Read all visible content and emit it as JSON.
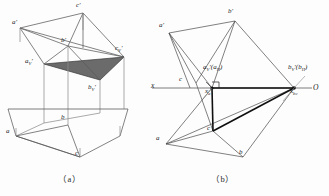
{
  "figure": {
    "title_caption_a": "（a）",
    "title_caption_b": "（b）",
    "colors": {
      "line": "#4a4a4a",
      "heavy_line": "#101010",
      "shade_fill": "#6b6b6b",
      "ground_line": "#5a5a5a",
      "text": "#1d1d1d"
    }
  },
  "panel_a": {
    "caption": "（a）",
    "labels": [
      {
        "name": "a-prime",
        "text": "a'",
        "x": 12,
        "y": 22
      },
      {
        "name": "c-prime",
        "text": "c'",
        "x": 76,
        "y": 4
      },
      {
        "name": "b-prime",
        "text": "b'",
        "x": 61,
        "y": 40
      },
      {
        "name": "cv-prime",
        "text": "c",
        "sub": "V",
        "prime": "'",
        "x": 115,
        "y": 47
      },
      {
        "name": "av-prime",
        "text": "a",
        "sub": "V",
        "prime": "'",
        "x": 25,
        "y": 60
      },
      {
        "name": "bv-prime",
        "text": "b",
        "sub": "V",
        "prime": "'",
        "x": 88,
        "y": 86
      },
      {
        "name": "a-point",
        "text": "a",
        "x": 7,
        "y": 130
      },
      {
        "name": "b-point",
        "text": "b",
        "x": 61,
        "y": 116
      },
      {
        "name": "c-point",
        "text": "c",
        "x": 74,
        "y": 150
      }
    ]
  },
  "panel_b": {
    "caption": "（b）",
    "labels": [
      {
        "name": "a-prime",
        "text": "a'",
        "x": 160,
        "y": 24
      },
      {
        "name": "b-prime",
        "text": "b'",
        "x": 228,
        "y": 10
      },
      {
        "name": "x-axis-label",
        "text": "x",
        "x": 152,
        "y": 84
      },
      {
        "name": "c-prime",
        "text": "c",
        "x": 179,
        "y": 78
      },
      {
        "name": "av-ah",
        "text": "a",
        "sub": "V",
        "prime": "'(a",
        "sub2": "H",
        "tail": ")",
        "x": 205,
        "y": 68
      },
      {
        "name": "xa",
        "text": "x",
        "sub": "a",
        "x": 206,
        "y": 89
      },
      {
        "name": "bv-bh",
        "text": "b",
        "sub": "V",
        "prime": "'(b",
        "sub2": "H",
        "tail": ")",
        "x": 290,
        "y": 68
      },
      {
        "name": "xbc",
        "text": "x",
        "sub": "bc",
        "x": 292,
        "y": 89
      },
      {
        "name": "origin",
        "text": "O",
        "x": 312,
        "y": 86
      },
      {
        "name": "a-point",
        "text": "a",
        "x": 157,
        "y": 137
      },
      {
        "name": "c-point",
        "text": "c",
        "x": 206,
        "y": 126
      },
      {
        "name": "b-point",
        "text": "b",
        "x": 239,
        "y": 150
      }
    ]
  },
  "geometry": {
    "panel_a": {
      "ground_line": {
        "x1": 8,
        "y1": 109,
        "x2": 128,
        "y2": 109
      },
      "vertices_top": {
        "a_prime": [
          20,
          28
        ],
        "c_prime": [
          83,
          13
        ],
        "b_prime": [
          68,
          46
        ]
      },
      "vertices_v": {
        "av": [
          44,
          64
        ],
        "cv": [
          124,
          57
        ],
        "bv": [
          100,
          80
        ]
      },
      "vertices_bottom": {
        "a": [
          16,
          136
        ],
        "b": [
          68,
          125
        ],
        "c": [
          80,
          157
        ]
      }
    },
    "panel_b": {
      "x_axis": {
        "x1": 152,
        "y1": 88,
        "x2": 312,
        "y2": 88
      },
      "vertices": {
        "a_prime": [
          169,
          33
        ],
        "b_prime": [
          235,
          21
        ],
        "av": [
          212,
          88
        ],
        "bv": [
          294,
          88
        ],
        "a": [
          166,
          144
        ],
        "b": [
          243,
          157
        ],
        "c": [
          213,
          131
        ]
      }
    }
  }
}
